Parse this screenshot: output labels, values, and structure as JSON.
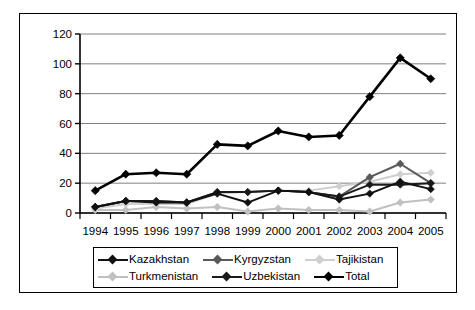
{
  "chart_data": {
    "type": "line",
    "title": "",
    "subtitle": "",
    "xlabel": "",
    "ylabel": "",
    "categories": [
      "1994",
      "1995",
      "1996",
      "1997",
      "1998",
      "1999",
      "2000",
      "2001",
      "2002",
      "2003",
      "2004",
      "2005"
    ],
    "x_tick_labels": [
      "1994",
      "1995",
      "1996",
      "1997",
      "1998",
      "1999",
      "2000",
      "2001",
      "2002",
      "2003",
      "2004",
      "2005"
    ],
    "y_tick_labels": [
      "0",
      "20",
      "40",
      "60",
      "80",
      "100",
      "120"
    ],
    "y_ticks": [
      0,
      20,
      40,
      60,
      80,
      100,
      120
    ],
    "ylim": [
      0,
      120
    ],
    "grid": "horizontal",
    "legend_position": "bottom",
    "marker": "diamond",
    "series": [
      {
        "name": "Kazakhstan",
        "color": "#111111",
        "width": 2.0,
        "values": [
          4,
          8,
          7,
          7,
          13,
          7,
          15,
          14,
          9,
          13,
          21,
          16
        ]
      },
      {
        "name": "Kyrgyzstan",
        "color": "#595959",
        "width": 2.0,
        "values": [
          4,
          8,
          8,
          7,
          14,
          14,
          15,
          14,
          11,
          24,
          33,
          20
        ]
      },
      {
        "name": "Tajikistan",
        "color": "#cfcfcf",
        "width": 2.0,
        "values": [
          3,
          6,
          6,
          6,
          13,
          14,
          15,
          15,
          18,
          21,
          26,
          27
        ]
      },
      {
        "name": "Turkmenistan",
        "color": "#c0c0c0",
        "width": 2.0,
        "values": [
          2,
          2,
          4,
          3,
          4,
          1,
          3,
          2,
          2,
          1,
          7,
          9
        ]
      },
      {
        "name": "Uzbekistan",
        "color": "#1a1a1a",
        "width": 2.0,
        "values": [
          4,
          8,
          8,
          7,
          14,
          14,
          15,
          14,
          11,
          19,
          19,
          20
        ]
      },
      {
        "name": "Total",
        "color": "#000000",
        "width": 2.6,
        "values": [
          15,
          26,
          27,
          26,
          46,
          45,
          55,
          51,
          52,
          78,
          104,
          90
        ]
      }
    ]
  },
  "legend": {
    "rows": [
      [
        {
          "label": "Kazakhstan",
          "color": "#111111"
        },
        {
          "label": "Kyrgyzstan",
          "color": "#595959"
        },
        {
          "label": "Tajikistan",
          "color": "#cfcfcf"
        }
      ],
      [
        {
          "label": "Turkmenistan",
          "color": "#c0c0c0"
        },
        {
          "label": "Uzbekistan",
          "color": "#1a1a1a"
        },
        {
          "label": "Total",
          "color": "#000000"
        }
      ]
    ]
  },
  "style": {
    "axis_color": "#000000",
    "grid_color": "#808080",
    "frame_color": "#000000",
    "background": "#ffffff"
  }
}
